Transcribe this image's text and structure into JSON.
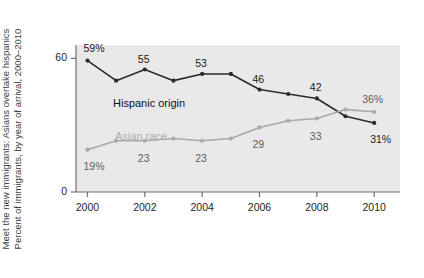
{
  "caption": {
    "line1": "Meet the new immigrants: Asians overtake hispanics",
    "line2": "Percent of immigrants, by year of arrival, 2000–2010"
  },
  "chart_data": {
    "type": "line",
    "title": "Meet the new immigrants: Asians overtake hispanics",
    "subtitle": "Percent of immigrants, by year of arrival, 2000–2010",
    "xlabel": "",
    "ylabel": "",
    "x": [
      2000,
      2001,
      2002,
      2003,
      2004,
      2005,
      2006,
      2007,
      2008,
      2009,
      2010
    ],
    "xtick_labels": [
      "2000",
      "2002",
      "2004",
      "2006",
      "2008",
      "2010"
    ],
    "xtick_values": [
      2000,
      2002,
      2004,
      2006,
      2008,
      2010
    ],
    "ytick_labels": [
      "0",
      "60"
    ],
    "ytick_values": [
      0,
      60
    ],
    "ylim": [
      0,
      66
    ],
    "xlim": [
      1999.6,
      2010.9
    ],
    "grid": false,
    "legend": "inline-annotations",
    "series": [
      {
        "name": "Hispanic origin",
        "color": "#2b2b2b",
        "values": [
          59,
          50,
          55,
          50,
          53,
          53,
          46,
          44,
          42,
          34,
          31
        ],
        "point_labels": [
          {
            "x": 2000,
            "value": 59,
            "text": "59%"
          },
          {
            "x": 2002,
            "value": 55,
            "text": "55"
          },
          {
            "x": 2004,
            "value": 53,
            "text": "53"
          },
          {
            "x": 2006,
            "value": 46,
            "text": "46"
          },
          {
            "x": 2008,
            "value": 42,
            "text": "42"
          },
          {
            "x": 2010,
            "value": 31,
            "text": "31%"
          }
        ]
      },
      {
        "name": "Asian race",
        "color": "#a9a9a9",
        "values": [
          19,
          23,
          23,
          24,
          23,
          24,
          29,
          32,
          33,
          37,
          36
        ],
        "point_labels": [
          {
            "x": 2000,
            "value": 19,
            "text": "19%"
          },
          {
            "x": 2002,
            "value": 23,
            "text": "23"
          },
          {
            "x": 2004,
            "value": 23,
            "text": "23"
          },
          {
            "x": 2006,
            "value": 29,
            "text": "29"
          },
          {
            "x": 2008,
            "value": 33,
            "text": "33"
          },
          {
            "x": 2010,
            "value": 36,
            "text": "36%"
          }
        ]
      }
    ],
    "colors": {
      "hispanic": "#2b2b2b",
      "asian": "#a9a9a9",
      "plot_background": "#e9e9e9",
      "page_background": "#ffffff",
      "axis": "#6e6e6e"
    }
  }
}
